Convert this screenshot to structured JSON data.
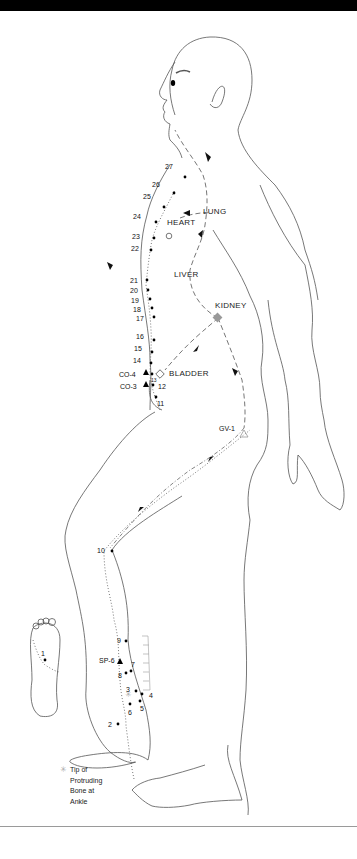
{
  "figure": {
    "title": "",
    "organs": {
      "lung": "LUNG",
      "heart": "HEART",
      "liver": "LIVER",
      "kidney": "KIDNEY",
      "bladder": "BLADDER"
    },
    "special_points": {
      "co4": "CO-4",
      "co3": "CO-3",
      "gv1": "GV-1",
      "sp6": "SP-6"
    },
    "points": [
      {
        "n": "1"
      },
      {
        "n": "2"
      },
      {
        "n": "3"
      },
      {
        "n": "4"
      },
      {
        "n": "5"
      },
      {
        "n": "6"
      },
      {
        "n": "7"
      },
      {
        "n": "8"
      },
      {
        "n": "9"
      },
      {
        "n": "10"
      },
      {
        "n": "11"
      },
      {
        "n": "12"
      },
      {
        "n": "13"
      },
      {
        "n": "14"
      },
      {
        "n": "15"
      },
      {
        "n": "16"
      },
      {
        "n": "17"
      },
      {
        "n": "18"
      },
      {
        "n": "19"
      },
      {
        "n": "20"
      },
      {
        "n": "21"
      },
      {
        "n": "22"
      },
      {
        "n": "23"
      },
      {
        "n": "24"
      },
      {
        "n": "25"
      },
      {
        "n": "26"
      },
      {
        "n": "27"
      }
    ],
    "legend": {
      "symbol": "✳",
      "text_lines": [
        "Tip of",
        "Protruding",
        "Bone at",
        "Ankle"
      ]
    },
    "colors": {
      "top_bar": "#000000",
      "outline": "#555555",
      "kidney_marker": "#999999"
    }
  }
}
